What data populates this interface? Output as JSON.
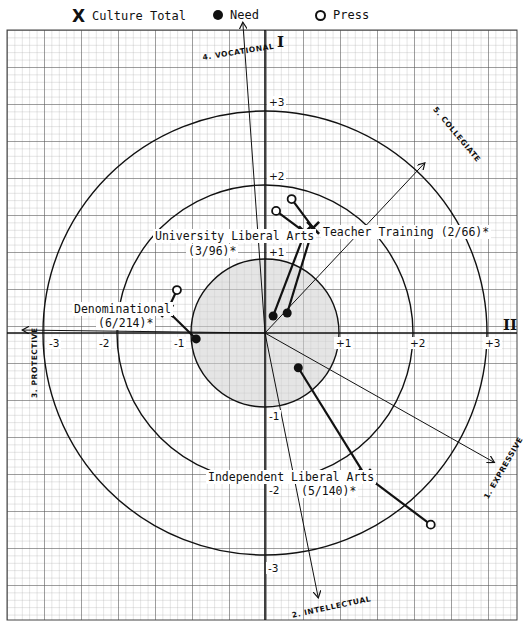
{
  "legend": {
    "culture_total": {
      "symbol": "X",
      "label": "Culture Total"
    },
    "need": {
      "symbol": "filled-circle",
      "label": "Need"
    },
    "press": {
      "symbol": "open-circle",
      "label": "Press"
    }
  },
  "quadrants": {
    "I": "I",
    "II": "II"
  },
  "axes": {
    "vocational": "4. VOCATIONAL",
    "collegiate": "5. COLLEGIATE",
    "protective": "3. PROTECTIVE",
    "intellectual": "2. INTELLECTUAL",
    "expressive": "1. EXPRESSIVE"
  },
  "ticks": {
    "x_pos": [
      "+1",
      "+2",
      "+3"
    ],
    "x_neg": [
      "-1",
      "-2",
      "-3"
    ],
    "y_pos": [
      "+1",
      "+2",
      "+3"
    ],
    "y_neg": [
      "-1",
      "-2",
      "-3"
    ]
  },
  "labels": {
    "university_liberal_arts": {
      "name": "University Liberal Arts",
      "count": "(3/96)*"
    },
    "teacher_training": {
      "name": "Teacher Training (2/66)*"
    },
    "denominational": {
      "name": "Denominational",
      "count": "(6/214)*"
    },
    "independent_liberal_arts": {
      "name": "Independent Liberal Arts",
      "count": "(5/140)*"
    }
  },
  "colors": {
    "grid_fine": "#9a9a9a",
    "grid_major": "#555555",
    "ink": "#111111",
    "shade": "#cfcfcf"
  },
  "chart_data": {
    "type": "scatter",
    "title": "",
    "xlabel": "II",
    "ylabel": "I",
    "xlim": [
      -3.4,
      3.4
    ],
    "ylim": [
      -3.9,
      4.2
    ],
    "grid": true,
    "legend_position": "top",
    "reference_circles_radius": [
      1,
      2,
      3
    ],
    "shaded_circle_radius": 1,
    "vector_axes": [
      {
        "name": "1. EXPRESSIVE",
        "end": [
          3.1,
          -1.75
        ]
      },
      {
        "name": "2. INTELLECTUAL",
        "end": [
          0.72,
          -3.58
        ]
      },
      {
        "name": "3. PROTECTIVE",
        "end": [
          -3.28,
          0.04
        ]
      },
      {
        "name": "4. VOCATIONAL",
        "end": [
          -0.3,
          4.2
        ]
      },
      {
        "name": "5. COLLEGIATE",
        "end": [
          2.16,
          2.3
        ]
      }
    ],
    "series": [
      {
        "name": "Teacher Training (2/66)*",
        "culture_total": [
          0.65,
          1.42
        ],
        "need": [
          0.3,
          0.27
        ],
        "press": [
          0.36,
          1.81
        ]
      },
      {
        "name": "University Liberal Arts (3/96)*",
        "culture_total": [
          0.54,
          1.36
        ],
        "need": [
          0.11,
          0.23
        ],
        "press": [
          0.15,
          1.65
        ]
      },
      {
        "name": "Denominational (6/214)*",
        "culture_total": [
          -1.32,
          0.3
        ],
        "need": [
          -0.93,
          -0.08
        ],
        "press": [
          -1.19,
          0.58
        ]
      },
      {
        "name": "Independent Liberal Arts (5/140)*",
        "culture_total": [
          1.35,
          -1.92
        ],
        "need": [
          0.45,
          -0.47
        ],
        "press": [
          2.24,
          -2.59
        ]
      }
    ]
  }
}
